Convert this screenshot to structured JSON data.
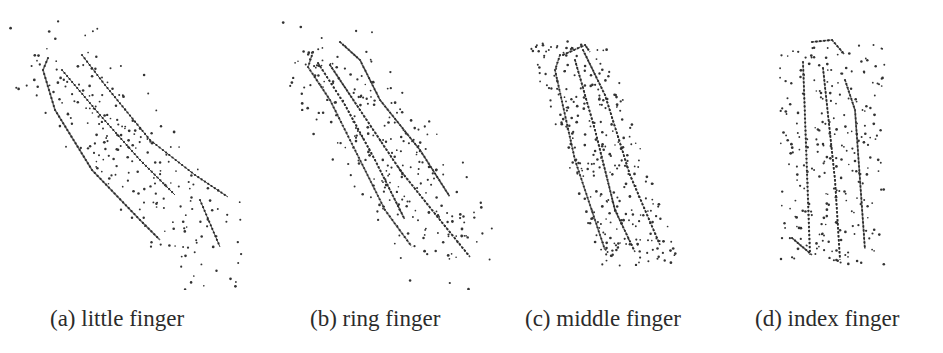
{
  "figure": {
    "type": "subfigure-grid",
    "panels": [
      {
        "id": "a",
        "caption": "(a) little finger",
        "caption_x": 50,
        "box": {
          "x": 0,
          "y": 20,
          "w": 260,
          "h": 270
        },
        "tilt": "diagonal",
        "lines": [
          [
            [
              48,
              58
            ],
            [
              43,
              70
            ],
            [
              55,
              110
            ],
            [
              92,
              170
            ],
            [
              140,
              220
            ],
            [
              160,
              240
            ]
          ],
          [
            [
              82,
              55
            ],
            [
              105,
              85
            ],
            [
              150,
              140
            ],
            [
              195,
              175
            ],
            [
              228,
              197
            ]
          ],
          [
            [
              62,
              70
            ],
            [
              100,
              115
            ],
            [
              140,
              160
            ],
            [
              175,
              195
            ]
          ],
          [
            [
              200,
              200
            ],
            [
              220,
              247
            ]
          ]
        ],
        "dot_regions": [
          {
            "x0": 25,
            "y0": 30,
            "x1": 245,
            "y1": 275,
            "count": 230,
            "seed": 11
          }
        ]
      },
      {
        "id": "b",
        "caption": "(b) ring finger",
        "caption_x": 310,
        "box": {
          "x": 270,
          "y": 20,
          "w": 230,
          "h": 270
        },
        "tilt": "diagonal",
        "lines": [
          [
            [
              313,
              52
            ],
            [
              308,
              67
            ],
            [
              330,
              100
            ],
            [
              350,
              140
            ],
            [
              385,
              210
            ],
            [
              412,
              247
            ]
          ],
          [
            [
              340,
              42
            ],
            [
              360,
              60
            ],
            [
              380,
              100
            ],
            [
              420,
              150
            ],
            [
              450,
              197
            ]
          ],
          [
            [
              330,
              65
            ],
            [
              360,
              110
            ],
            [
              400,
              170
            ],
            [
              440,
              220
            ],
            [
              470,
              257
            ]
          ],
          [
            [
              318,
              63
            ],
            [
              345,
              105
            ],
            [
              375,
              160
            ],
            [
              405,
              220
            ]
          ]
        ],
        "dot_regions": [
          {
            "x0": 300,
            "y0": 35,
            "x1": 475,
            "y1": 265,
            "count": 260,
            "seed": 23
          }
        ]
      },
      {
        "id": "c",
        "caption": "(c) middle finger",
        "caption_x": 525,
        "box": {
          "x": 520,
          "y": 20,
          "w": 200,
          "h": 270
        },
        "tilt": "steep",
        "lines": [
          [
            [
              560,
              55
            ],
            [
              555,
              70
            ],
            [
              575,
              160
            ],
            [
              605,
              250
            ]
          ],
          [
            [
              583,
              50
            ],
            [
              605,
              95
            ],
            [
              630,
              175
            ],
            [
              660,
              245
            ]
          ],
          [
            [
              575,
              60
            ],
            [
              595,
              130
            ],
            [
              615,
              210
            ],
            [
              635,
              252
            ]
          ],
          [
            [
              563,
              55
            ],
            [
              585,
              45
            ],
            [
              590,
              52
            ]
          ]
        ],
        "dot_regions": [
          {
            "x0": 545,
            "y0": 40,
            "x1": 685,
            "y1": 268,
            "count": 300,
            "seed": 37
          }
        ]
      },
      {
        "id": "d",
        "caption": "(d) index finger",
        "caption_x": 755,
        "box": {
          "x": 730,
          "y": 20,
          "w": 213,
          "h": 270
        },
        "tilt": "vertical",
        "lines": [
          [
            [
              803,
              62
            ],
            [
              810,
              255
            ]
          ],
          [
            [
              845,
              80
            ],
            [
              855,
              110
            ],
            [
              865,
              250
            ]
          ],
          [
            [
              823,
              68
            ],
            [
              835,
              180
            ],
            [
              840,
              260
            ]
          ],
          [
            [
              812,
              42
            ],
            [
              832,
              40
            ],
            [
              845,
              55
            ]
          ],
          [
            [
              792,
              238
            ],
            [
              812,
              255
            ]
          ]
        ],
        "dot_regions": [
          {
            "x0": 780,
            "y0": 45,
            "x1": 885,
            "y1": 265,
            "count": 260,
            "seed": 53
          }
        ]
      }
    ]
  }
}
